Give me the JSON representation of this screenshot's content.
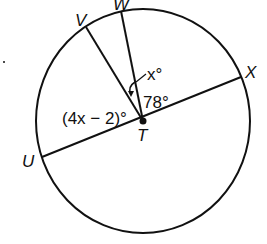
{
  "diagram": {
    "type": "circle-central-angles",
    "center_label": "T",
    "points": {
      "U": "U",
      "V": "V",
      "W": "W",
      "X": "X"
    },
    "angles": {
      "VTW": "x°",
      "WTX": "78°",
      "UTV": "(4x − 2)°"
    },
    "colors": {
      "stroke": "#111111",
      "background": "#ffffff"
    }
  }
}
